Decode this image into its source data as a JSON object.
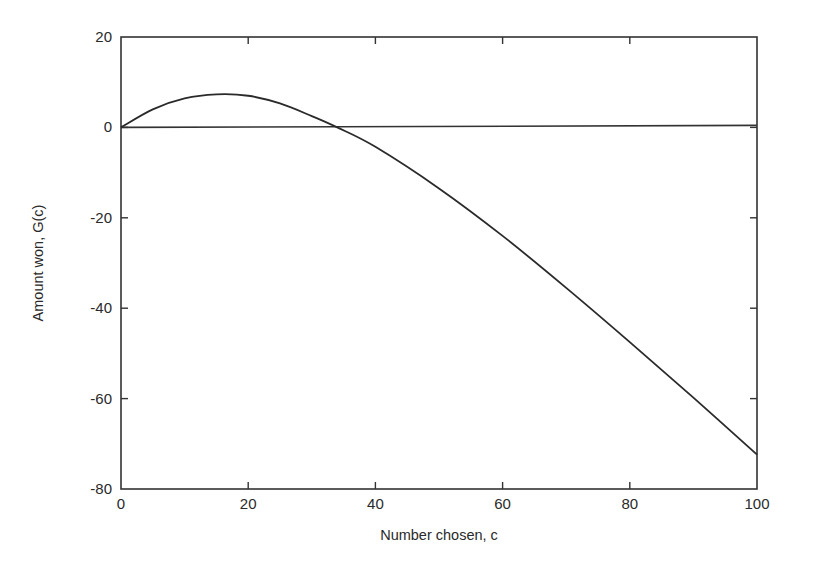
{
  "chart_data": {
    "type": "line",
    "title": "",
    "xlabel": "Number chosen, c",
    "ylabel": "Amount won, G(c)",
    "xlim": [
      0,
      100
    ],
    "ylim": [
      -80,
      20
    ],
    "xticks": [
      0,
      20,
      40,
      60,
      80,
      100
    ],
    "yticks": [
      20,
      0,
      -20,
      -40,
      -60,
      -80
    ],
    "grid": false,
    "legend": null,
    "reference_lines": [
      {
        "orientation": "horizontal",
        "y": 0
      }
    ],
    "series": [
      {
        "name": "G(c)",
        "x": [
          0,
          5,
          10,
          15,
          20,
          25,
          30,
          34,
          40,
          50,
          60,
          70,
          80,
          90,
          100
        ],
        "values": [
          0,
          4.0,
          6.4,
          7.3,
          7.0,
          5.3,
          2.5,
          0,
          -4.3,
          -13.5,
          -24.0,
          -35.5,
          -47.5,
          -59.8,
          -72.4
        ]
      }
    ]
  }
}
